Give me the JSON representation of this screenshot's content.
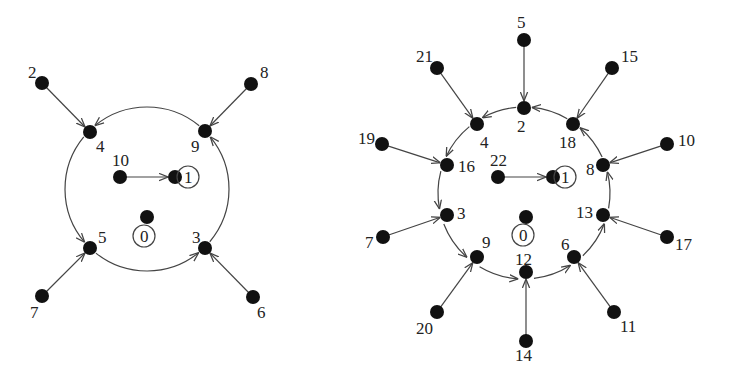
{
  "graphs": [
    {
      "name": "left-graph",
      "cycle": {
        "cx": 147,
        "cy": 189,
        "r": 82
      },
      "nodes": [
        {
          "id": "0",
          "x": 147,
          "y": 217,
          "lx": 140,
          "ly": 242,
          "loop": true
        },
        {
          "id": "1",
          "x": 175,
          "y": 177,
          "lx": 184,
          "ly": 183,
          "loop": true
        },
        {
          "id": "2",
          "x": 42,
          "y": 83,
          "lx": 28,
          "ly": 78
        },
        {
          "id": "3",
          "x": 205,
          "y": 248,
          "lx": 192,
          "ly": 243
        },
        {
          "id": "4",
          "x": 90,
          "y": 132,
          "lx": 96,
          "ly": 152
        },
        {
          "id": "5",
          "x": 90,
          "y": 248,
          "lx": 98,
          "ly": 243
        },
        {
          "id": "6",
          "x": 253,
          "y": 297,
          "lx": 257,
          "ly": 318
        },
        {
          "id": "7",
          "x": 42,
          "y": 296,
          "lx": 30,
          "ly": 318
        },
        {
          "id": "8",
          "x": 251,
          "y": 84,
          "lx": 260,
          "ly": 78
        },
        {
          "id": "9",
          "x": 205,
          "y": 131,
          "lx": 191,
          "ly": 152
        },
        {
          "id": "10",
          "x": 120,
          "y": 177,
          "lx": 112,
          "ly": 166
        }
      ],
      "edges": [
        [
          "2",
          "4"
        ],
        [
          "8",
          "9"
        ],
        [
          "7",
          "5"
        ],
        [
          "6",
          "3"
        ],
        [
          "10",
          "1"
        ],
        [
          "4",
          "5"
        ],
        [
          "5",
          "3"
        ],
        [
          "3",
          "9"
        ],
        [
          "9",
          "4"
        ]
      ]
    },
    {
      "name": "right-graph",
      "cycle": {
        "cx": 524,
        "cy": 193,
        "r": 86
      },
      "nodes": [
        {
          "id": "0",
          "x": 526,
          "y": 217,
          "lx": 519,
          "ly": 241,
          "loop": true
        },
        {
          "id": "1",
          "x": 553,
          "y": 177,
          "lx": 561,
          "ly": 183,
          "loop": true
        },
        {
          "id": "2",
          "x": 524,
          "y": 108,
          "lx": 517,
          "ly": 132
        },
        {
          "id": "3",
          "x": 447,
          "y": 215,
          "lx": 457,
          "ly": 219
        },
        {
          "id": "4",
          "x": 477,
          "y": 124,
          "lx": 480,
          "ly": 148
        },
        {
          "id": "5",
          "x": 524,
          "y": 40,
          "lx": 517,
          "ly": 28
        },
        {
          "id": "6",
          "x": 574,
          "y": 257,
          "lx": 561,
          "ly": 250
        },
        {
          "id": "7",
          "x": 383,
          "y": 237,
          "lx": 365,
          "ly": 248
        },
        {
          "id": "8",
          "x": 603,
          "y": 165,
          "lx": 586,
          "ly": 175
        },
        {
          "id": "9",
          "x": 477,
          "y": 257,
          "lx": 482,
          "ly": 248
        },
        {
          "id": "10",
          "x": 667,
          "y": 144,
          "lx": 678,
          "ly": 146
        },
        {
          "id": "11",
          "x": 614,
          "y": 312,
          "lx": 620,
          "ly": 332
        },
        {
          "id": "12",
          "x": 526,
          "y": 272,
          "lx": 515,
          "ly": 265
        },
        {
          "id": "13",
          "x": 603,
          "y": 215,
          "lx": 576,
          "ly": 218
        },
        {
          "id": "14",
          "x": 526,
          "y": 341,
          "lx": 515,
          "ly": 361
        },
        {
          "id": "15",
          "x": 612,
          "y": 68,
          "lx": 621,
          "ly": 62
        },
        {
          "id": "16",
          "x": 447,
          "y": 165,
          "lx": 458,
          "ly": 172
        },
        {
          "id": "17",
          "x": 667,
          "y": 237,
          "lx": 675,
          "ly": 250
        },
        {
          "id": "18",
          "x": 573,
          "y": 124,
          "lx": 559,
          "ly": 148
        },
        {
          "id": "19",
          "x": 382,
          "y": 144,
          "lx": 358,
          "ly": 144
        },
        {
          "id": "20",
          "x": 437,
          "y": 312,
          "lx": 416,
          "ly": 334
        },
        {
          "id": "21",
          "x": 437,
          "y": 68,
          "lx": 416,
          "ly": 62
        },
        {
          "id": "22",
          "x": 498,
          "y": 177,
          "lx": 490,
          "ly": 166
        }
      ],
      "edges": [
        [
          "5",
          "2"
        ],
        [
          "21",
          "4"
        ],
        [
          "15",
          "18"
        ],
        [
          "19",
          "16"
        ],
        [
          "10",
          "8"
        ],
        [
          "7",
          "3"
        ],
        [
          "17",
          "13"
        ],
        [
          "20",
          "9"
        ],
        [
          "14",
          "12"
        ],
        [
          "11",
          "6"
        ],
        [
          "22",
          "1"
        ],
        [
          "18",
          "2"
        ],
        [
          "2",
          "4"
        ],
        [
          "4",
          "16"
        ],
        [
          "16",
          "3"
        ],
        [
          "3",
          "9"
        ],
        [
          "9",
          "12"
        ],
        [
          "12",
          "6"
        ],
        [
          "6",
          "13"
        ],
        [
          "13",
          "8"
        ],
        [
          "8",
          "18"
        ]
      ]
    }
  ]
}
